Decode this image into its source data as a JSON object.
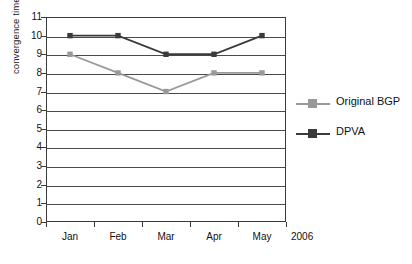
{
  "chart_data": {
    "type": "line",
    "title": "",
    "xlabel": "",
    "ylabel": "convergence time(s)",
    "x_axis_note": "2006",
    "categories": [
      "Jan",
      "Feb",
      "Mar",
      "Apr",
      "May"
    ],
    "ylim": [
      0,
      11
    ],
    "y_ticks": [
      0,
      1,
      2,
      3,
      4,
      5,
      6,
      7,
      8,
      9,
      10,
      11
    ],
    "grid": "horizontal",
    "legend_position": "right",
    "series": [
      {
        "name": "Original BGP",
        "color": "#999999",
        "marker": "square",
        "values": [
          9,
          8,
          7,
          8,
          8
        ]
      },
      {
        "name": "DPVA",
        "color": "#3a3a3a",
        "marker": "square",
        "values": [
          10,
          10,
          9,
          9,
          10
        ]
      }
    ]
  },
  "colors": {
    "axis": "#3b3b3b",
    "grid": "#4a4a4a",
    "background": "#ffffff",
    "text": "#111111"
  }
}
